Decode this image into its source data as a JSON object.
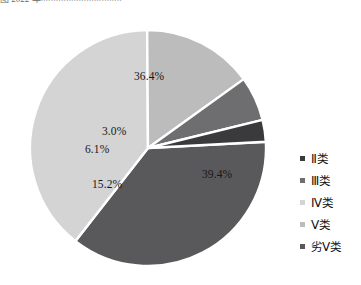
{
  "caption": {
    "text": "图 2022 年××××××××××××××××"
  },
  "chart_data": {
    "type": "pie",
    "title": "",
    "categories": [
      "Ⅱ类",
      "Ⅲ类",
      "Ⅳ类",
      "Ⅴ类",
      "劣Ⅴ类"
    ],
    "values": [
      3.0,
      6.1,
      39.4,
      15.2,
      36.4
    ],
    "value_labels": [
      "3.0%",
      "6.1%",
      "39.4%",
      "15.2%",
      "36.4%"
    ],
    "unit": "%",
    "legend_position": "right",
    "grid": false,
    "colors": [
      "#3a3a3c",
      "#6e6e70",
      "#d4d4d4",
      "#bcbcbc",
      "#59595b"
    ],
    "slice_border_color": "#ffffff",
    "start_angle_deg": -3,
    "direction": "clockwise",
    "slices": [
      {
        "label": "劣Ⅴ类",
        "value": 36.4,
        "display": "36.4%",
        "color": "#59595b"
      },
      {
        "label": "Ⅳ类",
        "value": 39.4,
        "display": "39.4%",
        "color": "#d4d4d4"
      },
      {
        "label": "Ⅴ类",
        "value": 15.2,
        "display": "15.2%",
        "color": "#bcbcbc"
      },
      {
        "label": "Ⅲ类",
        "value": 6.1,
        "display": "6.1%",
        "color": "#6e6e70"
      },
      {
        "label": "Ⅱ类",
        "value": 3.0,
        "display": "3.0%",
        "color": "#3a3a3c"
      }
    ]
  },
  "labels": {
    "top_slice": "36.4%",
    "right_slice": "39.4%",
    "bottom_left_slice": "15.2%",
    "left_slice": "6.1%",
    "left_small_slice": "3.0%"
  },
  "legend": {
    "items": [
      {
        "label": "Ⅱ类",
        "color": "#3a3a3c"
      },
      {
        "label": "Ⅲ类",
        "color": "#6e6e70"
      },
      {
        "label": "Ⅳ类",
        "color": "#d4d4d4"
      },
      {
        "label": "Ⅴ类",
        "color": "#bcbcbc"
      },
      {
        "label": "劣Ⅴ类",
        "color": "#59595b"
      }
    ]
  }
}
